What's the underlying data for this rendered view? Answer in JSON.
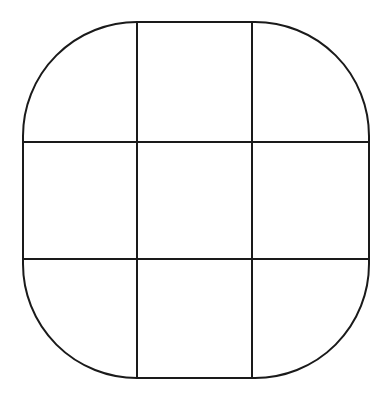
{
  "diagram": {
    "type": "rounded-square-grid",
    "rows": 3,
    "cols": 3,
    "stroke_color": "#1a1a1a",
    "background": "#ffffff",
    "bounds": {
      "x": 23,
      "y": 22,
      "width": 346,
      "height": 356,
      "corner_radius": 114
    },
    "vertical_lines_x": [
      137,
      252
    ],
    "horizontal_lines_y": [
      142,
      259
    ]
  }
}
